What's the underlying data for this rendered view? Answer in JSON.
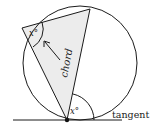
{
  "diagram": {
    "labels": {
      "angle_top": "x°",
      "angle_bottom": "x°",
      "chord": "chord",
      "tangent": "tangent"
    },
    "colors": {
      "stroke": "#1a1a1a",
      "shade": "#ececec",
      "background": "#ffffff"
    }
  }
}
